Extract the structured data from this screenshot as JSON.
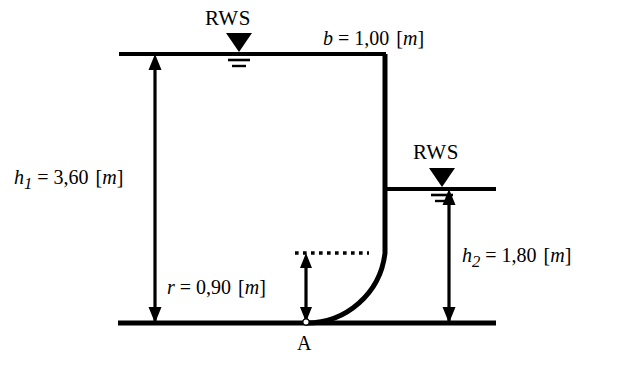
{
  "figure": {
    "type": "engineering-diagram",
    "labels": {
      "rws_left": "RWS",
      "rws_right": "RWS",
      "point_a": "A"
    },
    "dimensions": [
      {
        "id": "h1",
        "symbol": "h",
        "subscript": "1",
        "equals": "=",
        "value": "3,60",
        "unit": "m",
        "unit_open": "[",
        "unit_close": "]",
        "full_text": "h1 = 3,60 [m]",
        "meaning": "upstream water depth"
      },
      {
        "id": "h2",
        "symbol": "h",
        "subscript": "2",
        "equals": "=",
        "value": "1,80",
        "unit": "m",
        "unit_open": "[",
        "unit_close": "]",
        "full_text": "h2 = 1,80 [m]",
        "meaning": "downstream water depth"
      },
      {
        "id": "b",
        "symbol": "b",
        "subscript": "",
        "equals": "=",
        "value": "1,00",
        "unit": "m",
        "unit_open": "[",
        "unit_close": "]",
        "full_text": "b = 1,00 [m]",
        "meaning": "gate width"
      },
      {
        "id": "r",
        "symbol": "r",
        "subscript": "",
        "equals": "=",
        "value": "0,90",
        "unit": "m",
        "unit_open": "[",
        "unit_close": "]",
        "full_text": "r = 0,90 [m]",
        "meaning": "fillet radius of curved gate"
      }
    ],
    "colors": {
      "line": "#000000",
      "background": "#ffffff"
    },
    "geometry": {
      "upstream_water_line": {
        "x1": 119,
        "y1": 54,
        "x2": 386,
        "y2": 54
      },
      "downstream_water_line": {
        "x1": 385,
        "y1": 189,
        "x2": 496,
        "y2": 189
      },
      "ground_line": {
        "x1": 118,
        "y1": 323,
        "x2": 496,
        "y2": 323
      },
      "wall_vertical": {
        "x": 385,
        "y_top": 54,
        "y_bottom": 253
      },
      "fillet_arc": {
        "cx": 306,
        "cy": 253,
        "r": 79,
        "from": "wall",
        "to": "ground"
      },
      "dotted_center_line": {
        "x1": 295,
        "y1": 253,
        "x2": 369,
        "y2": 253
      },
      "point_a": {
        "x": 306,
        "y": 323
      }
    }
  }
}
